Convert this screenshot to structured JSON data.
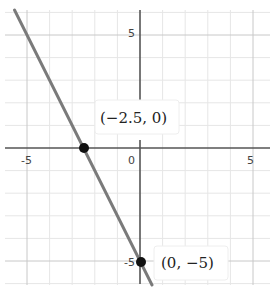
{
  "chart_data": {
    "type": "line",
    "title": "",
    "xlabel": "",
    "ylabel": "",
    "xlim": [
      -6.0,
      5.8
    ],
    "ylim": [
      -6.0,
      6.1
    ],
    "grid": true,
    "grid_minor_step": 1,
    "x_ticks": [
      -5,
      0,
      5
    ],
    "y_ticks": [
      5,
      -5
    ],
    "x_tick_labels": [
      "-5",
      "0",
      "5"
    ],
    "y_tick_labels": [
      "5",
      "-5"
    ],
    "series": [
      {
        "name": "y = -2x - 5",
        "slope": -2,
        "intercept": -5,
        "color": "#777777",
        "points": [
          {
            "x": -5.55,
            "y": 6.1
          },
          {
            "x": 0.53,
            "y": -6.06
          }
        ]
      }
    ],
    "annotations": [
      {
        "x": -2.5,
        "y": 0,
        "label": "(−2.5, 0)"
      },
      {
        "x": 0,
        "y": -5,
        "label": "(0, −5)"
      }
    ],
    "legend": null
  },
  "labels": {
    "x_neg5": "-5",
    "x_zero": "0",
    "x_pos5": "5",
    "y_pos5": "5",
    "y_neg5": "-5",
    "point_a": "(−2.5, 0)",
    "point_b": "(0, −5)"
  }
}
